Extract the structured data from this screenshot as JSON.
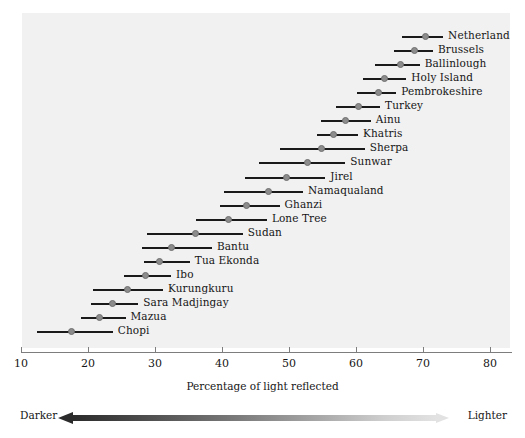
{
  "chart_data": {
    "type": "bar",
    "title": "",
    "xlabel": "Percentage of light reflected",
    "ylabel": "",
    "xlim": [
      10,
      80
    ],
    "xticks": [
      10,
      20,
      30,
      40,
      50,
      60,
      70,
      80
    ],
    "grid": false,
    "legend_position": "bottom",
    "series_note": "Each row shows a population's range (line) and mean (dot) of skin reflectance",
    "categories": [
      "Netherlands",
      "Brussels",
      "Ballinlough",
      "Holy Island",
      "Pembrokeshire",
      "Turkey",
      "Ainu",
      "Khatris",
      "Sherpa",
      "Sunwar",
      "Jirel",
      "Namaqualand",
      "Ghanzi",
      "Lone Tree",
      "Sudan",
      "Bantu",
      "Tua Ekonda",
      "Ibo",
      "Kurungkuru",
      "Sara Madjingay",
      "Mazua",
      "Chopi"
    ],
    "points": [
      {
        "label": "Netherlands",
        "low": 66.9,
        "mean": 70.3,
        "high": 73.0
      },
      {
        "label": "Brussels",
        "low": 65.7,
        "mean": 68.7,
        "high": 71.5
      },
      {
        "label": "Ballinlough",
        "low": 62.8,
        "mean": 66.6,
        "high": 69.5
      },
      {
        "label": "Holy Island",
        "low": 61.0,
        "mean": 64.2,
        "high": 67.5
      },
      {
        "label": "Pembrokeshire",
        "low": 60.1,
        "mean": 63.3,
        "high": 66.0
      },
      {
        "label": "Turkey",
        "low": 57.0,
        "mean": 60.3,
        "high": 63.6
      },
      {
        "label": "Ainu",
        "low": 54.8,
        "mean": 58.4,
        "high": 62.2
      },
      {
        "label": "Khatris",
        "low": 54.2,
        "mean": 56.7,
        "high": 60.3
      },
      {
        "label": "Sherpa",
        "low": 48.6,
        "mean": 54.9,
        "high": 61.3
      },
      {
        "label": "Sunwar",
        "low": 45.5,
        "mean": 52.7,
        "high": 58.4
      },
      {
        "label": "Jirel",
        "low": 43.4,
        "mean": 49.7,
        "high": 55.4
      },
      {
        "label": "Namaqualand",
        "low": 40.3,
        "mean": 47.0,
        "high": 52.1
      },
      {
        "label": "Ghanzi",
        "low": 39.7,
        "mean": 43.7,
        "high": 48.6
      },
      {
        "label": "Lone Tree",
        "low": 36.1,
        "mean": 40.9,
        "high": 46.7
      },
      {
        "label": "Sudan",
        "low": 28.8,
        "mean": 36.1,
        "high": 43.1
      },
      {
        "label": "Bantu",
        "low": 28.0,
        "mean": 32.4,
        "high": 38.5
      },
      {
        "label": "Tua Ekonda",
        "low": 28.3,
        "mean": 30.6,
        "high": 35.2
      },
      {
        "label": "Ibo",
        "low": 25.3,
        "mean": 28.6,
        "high": 32.4
      },
      {
        "label": "Kurungkuru",
        "low": 20.8,
        "mean": 25.9,
        "high": 31.2
      },
      {
        "label": "Sara Madjingay",
        "low": 20.5,
        "mean": 23.6,
        "high": 27.5
      },
      {
        "label": "Mazua",
        "low": 19.0,
        "mean": 21.7,
        "high": 25.6
      },
      {
        "label": "Chopi",
        "low": 12.4,
        "mean": 17.6,
        "high": 23.7
      }
    ]
  },
  "axis": {
    "title": "Percentage of light reflected",
    "tick_labels": [
      "10",
      "20",
      "30",
      "40",
      "50",
      "60",
      "70",
      "80"
    ]
  },
  "legend": {
    "darker_label": "Darker",
    "lighter_label": "Lighter",
    "gradient_dark": "#2b2b2b",
    "gradient_light": "#e2e2e2"
  },
  "style": {
    "panel_background": "#f1f1f1",
    "line_color": "#1a1a1a",
    "dot_color": "#8c8c8c",
    "text_color": "#161616"
  }
}
